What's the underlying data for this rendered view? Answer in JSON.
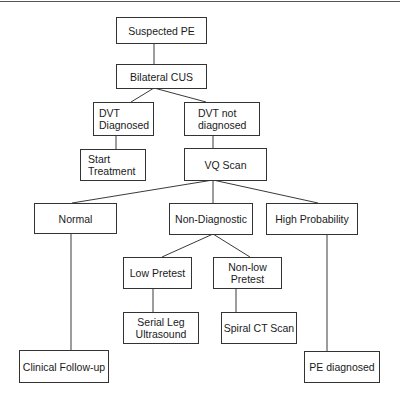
{
  "diagram": {
    "type": "flowchart",
    "nodes": {
      "suspected_pe": "Suspected PE",
      "bilateral_cus": "Bilateral CUS",
      "dvt_diagnosed": "DVT\nDiagnosed",
      "dvt_not_diagnosed": "DVT not\ndiagnosed",
      "start_treatment": "Start\nTreatment",
      "vq_scan": "VQ Scan",
      "normal": "Normal",
      "non_diagnostic": "Non-Diagnostic",
      "high_probability": "High Probability",
      "low_pretest": "Low Pretest",
      "non_low_pretest": "Non-low\nPretest",
      "serial_leg_ultrasound": "Serial Leg\nUltrasound",
      "spiral_ct_scan": "Spiral CT Scan",
      "clinical_follow_up": "Clinical Follow-up",
      "pe_diagnosed": "PE diagnosed"
    },
    "edges": [
      [
        "Suspected PE",
        "Bilateral CUS"
      ],
      [
        "Bilateral CUS",
        "DVT Diagnosed"
      ],
      [
        "Bilateral CUS",
        "DVT not diagnosed"
      ],
      [
        "DVT Diagnosed",
        "Start Treatment"
      ],
      [
        "DVT not diagnosed",
        "VQ Scan"
      ],
      [
        "VQ Scan",
        "Normal"
      ],
      [
        "VQ Scan",
        "Non-Diagnostic"
      ],
      [
        "VQ Scan",
        "High Probability"
      ],
      [
        "Non-Diagnostic",
        "Low Pretest"
      ],
      [
        "Non-Diagnostic",
        "Non-low Pretest"
      ],
      [
        "Low Pretest",
        "Serial Leg Ultrasound"
      ],
      [
        "Non-low Pretest",
        "Spiral CT Scan"
      ],
      [
        "Normal",
        "Clinical Follow-up"
      ],
      [
        "High Probability",
        "PE diagnosed"
      ]
    ]
  }
}
